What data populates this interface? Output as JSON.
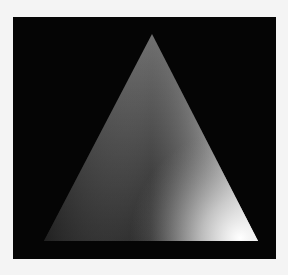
{
  "figure": {
    "background_color": "#050505",
    "page_color": "#f4f4f4",
    "triangle": {
      "vertices": [
        {
          "name": "apex",
          "x": 152,
          "y": 34,
          "color": "#6e6e6e"
        },
        {
          "name": "bottom-left",
          "x": 44,
          "y": 241,
          "color": "#1e1e1e"
        },
        {
          "name": "bottom-right",
          "x": 258,
          "y": 241,
          "color": "#ffffff"
        }
      ]
    }
  }
}
